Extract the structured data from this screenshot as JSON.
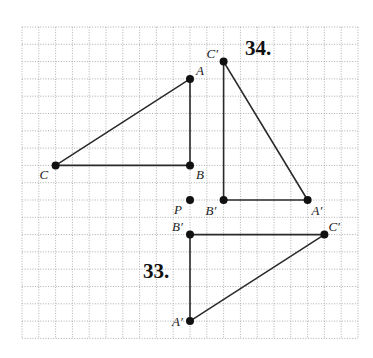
{
  "figure": {
    "grid": {
      "origin_x": 22,
      "origin_y": 27,
      "step_x": 16.8,
      "step_y": 17.3,
      "cols": 20,
      "rows": 18,
      "line_color": "#9a9a9a"
    },
    "colors": {
      "edge": "#2a2a2a",
      "point": "#111111",
      "label": "#222222"
    },
    "problems": [
      {
        "number": "34.",
        "label_pos": [
          245,
          55
        ]
      },
      {
        "number": "33.",
        "label_pos": [
          143,
          278
        ]
      }
    ],
    "center_point": {
      "name": "P",
      "at": [
        10,
        10
      ],
      "label_offset": [
        -16,
        14
      ]
    },
    "shapes": [
      {
        "id": "triangle-ABC",
        "points": [
          {
            "name": "A",
            "at": [
              10,
              3
            ],
            "label_offset": [
              6,
              -4
            ]
          },
          {
            "name": "B",
            "at": [
              10,
              8
            ],
            "label_offset": [
              6,
              14
            ]
          },
          {
            "name": "C",
            "at": [
              2,
              8
            ],
            "label_offset": [
              -16,
              14
            ]
          }
        ]
      },
      {
        "id": "triangle-34-image",
        "points": [
          {
            "name": "C′",
            "at": [
              12,
              2
            ],
            "label_offset": [
              -17,
              -4
            ]
          },
          {
            "name": "B′",
            "at": [
              12,
              10
            ],
            "label_offset": [
              -18,
              15
            ]
          },
          {
            "name": "A′",
            "at": [
              17,
              10
            ],
            "label_offset": [
              4,
              15
            ]
          }
        ]
      },
      {
        "id": "triangle-33-image",
        "points": [
          {
            "name": "B′",
            "at": [
              10,
              12
            ],
            "label_offset": [
              -18,
              -4
            ]
          },
          {
            "name": "C′",
            "at": [
              18,
              12
            ],
            "label_offset": [
              4,
              -4
            ]
          },
          {
            "name": "A′",
            "at": [
              10,
              17
            ],
            "label_offset": [
              -18,
              5
            ]
          }
        ]
      }
    ]
  }
}
